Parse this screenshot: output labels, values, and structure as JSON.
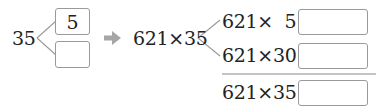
{
  "decomposition": {
    "number": "35",
    "parts": [
      {
        "value": "5"
      },
      {
        "value": ""
      }
    ]
  },
  "arrow": {
    "icon": "right-arrow-icon",
    "color": "#a6a6a6"
  },
  "expression": "621×35",
  "partial_products": [
    {
      "label": "621×  5=",
      "answer": ""
    },
    {
      "label": "621×30=",
      "answer": ""
    }
  ],
  "total": {
    "label": "621×35=",
    "answer": ""
  },
  "colors": {
    "text": "#222222",
    "box_border": "#9a9a9a",
    "lines": "#9a9a9a",
    "divider": "#8a8a8a"
  }
}
